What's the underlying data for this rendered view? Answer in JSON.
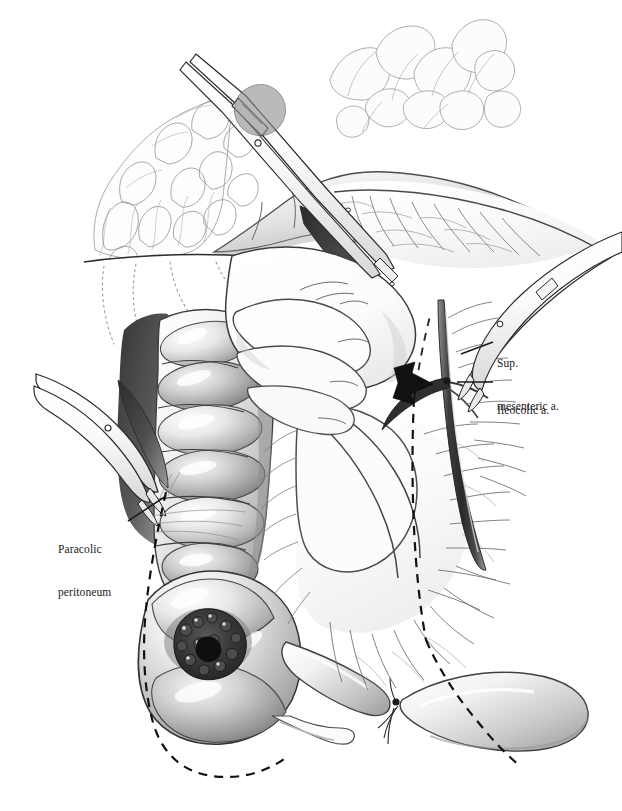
{
  "figure": {
    "kind": "surgical-illustration",
    "technique": "pen-and-ink / graphite wash, monochrome",
    "background_color": "#ffffff",
    "ink_color": "#1a1a1a"
  },
  "labels": [
    {
      "id": "sup-mesenteric-a",
      "name": "superior-mesenteric-artery-label",
      "line1": "Sup.",
      "line2": "mesenteric a.",
      "text_x": 497,
      "text_y": 327,
      "leader": {
        "from_x": 493,
        "from_y": 342,
        "to_x": 461,
        "to_y": 354
      }
    },
    {
      "id": "ileocolic-a",
      "name": "ileocolic-artery-label",
      "line1": "Ileocolic a.",
      "line2": "",
      "text_x": 497,
      "text_y": 374,
      "leader": {
        "from_x": 493,
        "from_y": 382,
        "to_x": 459,
        "to_y": 382
      }
    },
    {
      "id": "paracolic-peritoneum",
      "name": "paracolic-peritoneum-label",
      "line1": "Paracolic",
      "line2": "peritoneum",
      "text_x": 58,
      "text_y": 513,
      "leader": {
        "from_x": 128,
        "from_y": 521,
        "to_x": 164,
        "to_y": 497
      }
    }
  ],
  "annotations": {
    "arrow": {
      "name": "retraction-direction-arrow",
      "fill": "#111111",
      "tip_x": 432,
      "tip_y": 384,
      "tail_x": 396,
      "tail_y": 374,
      "meaning": "direction of medial-to-lateral retraction"
    }
  },
  "anatomy": [
    {
      "id": "greater-omentum",
      "name": "greater-omentum",
      "note": "fatty lobulated omentum, upper left quadrant"
    },
    {
      "id": "transverse-colon",
      "name": "transverse-colon",
      "note": "haustrated bowel across upper field"
    },
    {
      "id": "transverse-mesocolon",
      "name": "transverse-mesocolon",
      "note": "translucent fan with arcade vessels, upper right"
    },
    {
      "id": "ascending-colon",
      "name": "ascending-colon",
      "note": "haustrated segments, left of center"
    },
    {
      "id": "cecum",
      "name": "cecum",
      "note": "large sacculated pouch, lower left"
    },
    {
      "id": "tumor",
      "name": "cecal-tumor",
      "note": "dark ulcerated exophytic mass on cecal wall"
    },
    {
      "id": "appendix",
      "name": "appendix",
      "note": "slender blind tube at cecal base"
    },
    {
      "id": "terminal-ileum",
      "name": "terminal-ileum",
      "note": "small bowel loops, lower right"
    },
    {
      "id": "ileocolic-mesentery",
      "name": "ileocolic-mesentery",
      "note": "fan of mesentery with radiating vasa recta"
    },
    {
      "id": "sma-trunk",
      "name": "superior-mesenteric-artery",
      "note": "dark vertical vascular trunk, right of center"
    },
    {
      "id": "ileocolic-artery",
      "name": "ileocolic-artery",
      "note": "branch leaving SMA toward cecum"
    },
    {
      "id": "surgeons-hand",
      "name": "surgeons-hand",
      "note": "gloved hand, fingers flexed, retracting mesentery"
    },
    {
      "id": "drape",
      "name": "surgical-drape",
      "note": "white towel/drape with stippled fold lines"
    }
  ],
  "instruments": [
    {
      "id": "clamp-top",
      "name": "upper-surgical-clamp",
      "note": "long straight clamp angled from upper left across transverse colon"
    },
    {
      "id": "clamp-left",
      "name": "left-curved-clamp",
      "note": "curved hemostat entering from left margin"
    },
    {
      "id": "clamp-right",
      "name": "right-curved-clamp",
      "note": "curved clamp entering from upper right toward SMA"
    }
  ],
  "resection_lines": [
    {
      "id": "paracolic-line",
      "name": "paracolic-resection-line",
      "style": "dashed",
      "note": "curves down the lateral side of the cecum and ascending colon"
    },
    {
      "id": "mesenteric-line",
      "name": "mesenteric-resection-line",
      "style": "dashed",
      "note": "runs vertically through mesentery just left of the SMA, then obliquely across the ileum"
    }
  ]
}
